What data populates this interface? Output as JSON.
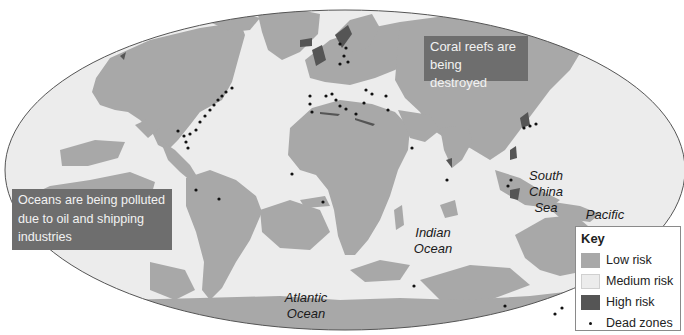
{
  "map": {
    "projection": "elliptical world map",
    "colors": {
      "background": "#ffffff",
      "ocean_medium_risk": "#ececec",
      "low_risk": "#a8a8a8",
      "high_risk": "#555555",
      "dead_zone": "#111111",
      "border_lines": "#c8c8c8",
      "ellipse_outline": "#555555",
      "annotation_bg": "#6e6e6e",
      "annotation_text": "#f2f2f2"
    },
    "ocean_labels": {
      "south_china_sea": "South China Sea",
      "scs_line1": "South",
      "scs_line2": "China",
      "scs_line3": "Sea",
      "pacific_line1": "Pacific",
      "pacific_line2": "Ocean",
      "indian_line1": "Indian",
      "indian_line2": "Ocean",
      "atlantic_line1": "Atlantic",
      "atlantic_line2": "Ocean"
    },
    "annotations": {
      "coral_reefs": "Coral reefs are being destroyed",
      "coral_line1": "Coral reefs are",
      "coral_line2": "being destroyed",
      "pollution": "Oceans are being polluted due to oil and shipping industries",
      "pollution_line1": "Oceans are being polluted",
      "pollution_line2": "due to oil and shipping",
      "pollution_line3": "industries"
    },
    "dead_zone_regions": [
      "US East Coast",
      "Gulf of Mexico",
      "Caribbean / Venezuela",
      "West Africa",
      "Gulf of Guinea",
      "Baltic Sea",
      "Western Europe",
      "Mediterranean",
      "Black Sea",
      "Caspian",
      "Persian Gulf",
      "India west coast",
      "East China / Japan",
      "South China Sea",
      "Australia east coast",
      "Madagascar / Indian Ocean",
      "Australia west"
    ]
  },
  "legend": {
    "title": "Key",
    "items": [
      {
        "label": "Low risk",
        "color": "#a8a8a8",
        "kind": "swatch"
      },
      {
        "label": "Medium risk",
        "color": "#ececec",
        "kind": "swatch"
      },
      {
        "label": "High risk",
        "color": "#555555",
        "kind": "swatch"
      },
      {
        "label": "Dead zones",
        "color": "#111111",
        "kind": "dot"
      }
    ]
  }
}
